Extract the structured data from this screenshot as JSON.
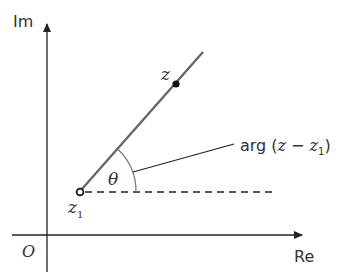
{
  "diagram": {
    "axes": {
      "imag_label": "Im",
      "real_label": "Re",
      "origin_label": "O"
    },
    "points": {
      "z_label": "z",
      "z1_label": "z",
      "z1_subscript": "1"
    },
    "angle": {
      "symbol": "θ",
      "annotation_prefix": "arg (",
      "annotation_z": "z",
      "annotation_minus": " − ",
      "annotation_z1": "z",
      "annotation_z1_sub": "1",
      "annotation_suffix": ")"
    },
    "colors": {
      "axis": "#222222",
      "line": "#666666",
      "text": "#333333",
      "background": "#ffffff"
    }
  }
}
